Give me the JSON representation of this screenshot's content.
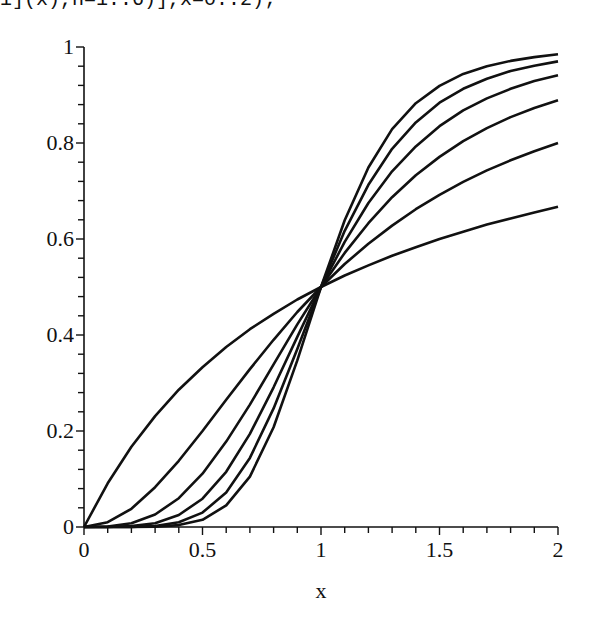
{
  "command_fragment": "i](x),n=1..6)],x=0..2);",
  "chart_data": {
    "type": "line",
    "title": "",
    "xlabel": "x",
    "ylabel": "",
    "xlim": [
      0,
      2
    ],
    "ylim": [
      0,
      1
    ],
    "grid": false,
    "legend": null,
    "x_ticks": [
      "0",
      "0.5",
      "1",
      "1.5",
      "2"
    ],
    "y_ticks": [
      "0",
      "0.2",
      "0.4",
      "0.6",
      "0.8",
      "1"
    ],
    "line_color": "#111111",
    "x": [
      0,
      0.1,
      0.2,
      0.3,
      0.4,
      0.5,
      0.6,
      0.7,
      0.8,
      0.9,
      1.0,
      1.1,
      1.2,
      1.3,
      1.4,
      1.5,
      1.6,
      1.7,
      1.8,
      1.9,
      2.0
    ],
    "series": [
      {
        "name": "n=1",
        "values": [
          0,
          0.091,
          0.167,
          0.231,
          0.286,
          0.333,
          0.375,
          0.412,
          0.444,
          0.474,
          0.5,
          0.524,
          0.545,
          0.565,
          0.583,
          0.6,
          0.615,
          0.63,
          0.643,
          0.655,
          0.667
        ]
      },
      {
        "name": "n=2",
        "values": [
          0,
          0.01,
          0.038,
          0.083,
          0.138,
          0.2,
          0.265,
          0.329,
          0.39,
          0.448,
          0.5,
          0.548,
          0.59,
          0.628,
          0.662,
          0.692,
          0.719,
          0.743,
          0.764,
          0.783,
          0.8
        ]
      },
      {
        "name": "n=3",
        "values": [
          0,
          0.001,
          0.008,
          0.026,
          0.06,
          0.111,
          0.178,
          0.255,
          0.339,
          0.422,
          0.5,
          0.571,
          0.633,
          0.687,
          0.733,
          0.771,
          0.804,
          0.831,
          0.854,
          0.873,
          0.889
        ]
      },
      {
        "name": "n=4",
        "values": [
          0,
          0.0001,
          0.002,
          0.008,
          0.025,
          0.059,
          0.115,
          0.194,
          0.291,
          0.396,
          0.5,
          0.594,
          0.675,
          0.741,
          0.793,
          0.835,
          0.868,
          0.893,
          0.913,
          0.929,
          0.941
        ]
      },
      {
        "name": "n=5",
        "values": [
          0,
          0,
          0.0003,
          0.002,
          0.01,
          0.03,
          0.072,
          0.144,
          0.247,
          0.371,
          0.5,
          0.617,
          0.713,
          0.788,
          0.843,
          0.884,
          0.913,
          0.934,
          0.95,
          0.961,
          0.97
        ]
      },
      {
        "name": "n=6",
        "values": [
          0,
          0,
          0.0001,
          0.0007,
          0.004,
          0.015,
          0.045,
          0.105,
          0.208,
          0.347,
          0.5,
          0.639,
          0.749,
          0.829,
          0.883,
          0.919,
          0.944,
          0.96,
          0.971,
          0.979,
          0.985
        ]
      }
    ]
  }
}
